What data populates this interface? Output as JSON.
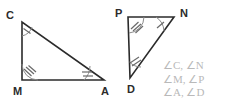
{
  "figure": {
    "background_color": "#ffffff",
    "stroke_color": "#2b2b2b",
    "tick_color": "#6a6a6a",
    "list_text_color": "#b9b9b9"
  },
  "triangles": [
    {
      "name": "triangle-CMA",
      "vertices": [
        {
          "label": "C",
          "x": 22,
          "y": 22,
          "label_x": 6,
          "label_y": 10,
          "ticks": 1
        },
        {
          "label": "M",
          "x": 22,
          "y": 80,
          "label_x": 13,
          "label_y": 86,
          "ticks": 3
        },
        {
          "label": "A",
          "x": 104,
          "y": 80,
          "label_x": 101,
          "label_y": 86,
          "ticks": 2
        }
      ]
    },
    {
      "name": "triangle-PND",
      "vertices": [
        {
          "label": "P",
          "x": 128,
          "y": 17,
          "label_x": 115,
          "label_y": 8,
          "ticks": 3
        },
        {
          "label": "N",
          "x": 174,
          "y": 17,
          "label_x": 180,
          "label_y": 8,
          "ticks": 1
        },
        {
          "label": "D",
          "x": 130,
          "y": 78,
          "label_x": 127,
          "label_y": 84,
          "ticks": 2
        }
      ]
    }
  ],
  "angle_list": {
    "name": "angle-correspondence-list",
    "rows": [
      "∠C,  ∠N",
      "∠M,  ∠P",
      "∠A,  ∠D"
    ]
  }
}
